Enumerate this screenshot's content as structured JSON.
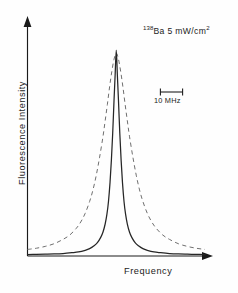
{
  "figure": {
    "background_color": "#fefefe",
    "annotation": {
      "isotope_mass": "138",
      "element": "Ba",
      "intensity": "5  mW/cm",
      "intensity_exponent": "2"
    },
    "scalebar": {
      "label": "10 MHz",
      "value_mhz": 10,
      "pixel_length": 23
    },
    "axes": {
      "x_label": "Frequency",
      "y_label": "Fluorescence Intensity",
      "x_color": "#1a1a1a",
      "y_color": "#1a1a1a",
      "arrows": true,
      "ticks": false,
      "grid": false
    }
  },
  "chart_data": {
    "type": "line",
    "title": "",
    "subtitle": "",
    "xlabel": "Frequency",
    "ylabel": "Fluorescence Intensity",
    "annotations": [
      "138Ba 5 mW/cm2",
      "10 MHz"
    ],
    "legend_position": "none",
    "xlim": [
      -40,
      40
    ],
    "ylim": [
      0,
      1.05
    ],
    "x_unit": "MHz (relative)",
    "y_unit": "arbitrary units",
    "axis_ticks_shown": false,
    "series": [
      {
        "name": "Observed spectrum",
        "style": "solid",
        "color": "#262626",
        "peak_center_mhz": 0,
        "peak_height": 1.0,
        "fwhm_mhz": 7.0,
        "profile": "lorentzian",
        "x": [
          -40,
          -36,
          -32,
          -28,
          -24,
          -20,
          -17,
          -14,
          -12,
          -10,
          -8.5,
          -7,
          -6,
          -5,
          -4.2,
          -3.5,
          -2.8,
          -2.2,
          -1.6,
          -1.0,
          -0.5,
          0,
          0.5,
          1.0,
          1.6,
          2.2,
          2.8,
          3.5,
          4.2,
          5,
          6,
          7,
          8.5,
          10,
          12,
          14,
          17,
          20,
          24,
          28,
          32,
          36,
          40
        ],
        "y": [
          0.003,
          0.004,
          0.005,
          0.006,
          0.008,
          0.012,
          0.016,
          0.024,
          0.032,
          0.046,
          0.061,
          0.087,
          0.112,
          0.152,
          0.2,
          0.262,
          0.355,
          0.462,
          0.594,
          0.755,
          0.878,
          1.0,
          0.878,
          0.755,
          0.594,
          0.462,
          0.355,
          0.262,
          0.2,
          0.152,
          0.112,
          0.087,
          0.061,
          0.046,
          0.032,
          0.024,
          0.016,
          0.012,
          0.008,
          0.006,
          0.005,
          0.004,
          0.003
        ]
      },
      {
        "name": "Calculated / comparison profile",
        "style": "dashed",
        "color": "#6f6f6f",
        "peak_center_mhz": 0,
        "peak_height": 0.985,
        "fwhm_mhz": 15.0,
        "profile": "broadened",
        "x": [
          -40,
          -36,
          -32,
          -28,
          -24,
          -21,
          -18,
          -16,
          -14,
          -12,
          -10.5,
          -9,
          -7.5,
          -6,
          -5,
          -4,
          -3,
          -2,
          -1,
          0,
          1,
          2,
          3,
          4,
          5,
          6,
          7.5,
          9,
          10.5,
          12,
          14,
          16,
          18,
          21,
          24,
          28,
          32,
          36,
          40
        ],
        "y": [
          0.028,
          0.034,
          0.043,
          0.056,
          0.077,
          0.098,
          0.131,
          0.162,
          0.204,
          0.262,
          0.318,
          0.39,
          0.478,
          0.577,
          0.655,
          0.735,
          0.82,
          0.895,
          0.955,
          0.985,
          0.955,
          0.895,
          0.82,
          0.735,
          0.655,
          0.577,
          0.478,
          0.39,
          0.318,
          0.262,
          0.204,
          0.162,
          0.131,
          0.098,
          0.077,
          0.056,
          0.043,
          0.034,
          0.028
        ]
      }
    ]
  }
}
